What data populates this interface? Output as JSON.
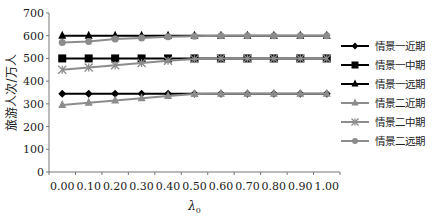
{
  "chart_data": {
    "type": "line",
    "title": "",
    "xlabel": "λ0",
    "ylabel": "旅游人次/万人",
    "ylim": [
      0,
      700
    ],
    "yticks": [
      0,
      100,
      200,
      300,
      400,
      500,
      600,
      700
    ],
    "grid": false,
    "legend_position": "right",
    "x": [
      "0.00",
      "0.10",
      "0.20",
      "0.30",
      "0.40",
      "0.50",
      "0.60",
      "0.70",
      "0.80",
      "0.90",
      "1.00"
    ],
    "series": [
      {
        "name": "情景一近期",
        "marker": "diamond",
        "color": "#000000",
        "values": [
          345,
          345,
          345,
          345,
          345,
          345,
          345,
          345,
          345,
          345,
          345
        ]
      },
      {
        "name": "情景一中期",
        "marker": "square",
        "color": "#000000",
        "values": [
          500,
          500,
          500,
          500,
          500,
          500,
          500,
          500,
          500,
          500,
          500
        ]
      },
      {
        "name": "情景一远期",
        "marker": "triangle",
        "color": "#000000",
        "values": [
          600,
          600,
          600,
          600,
          600,
          600,
          600,
          600,
          600,
          600,
          600
        ]
      },
      {
        "name": "情景二近期",
        "marker": "triangle",
        "color": "#8c8c8c",
        "values": [
          295,
          305,
          315,
          325,
          335,
          343,
          345,
          345,
          345,
          345,
          345
        ]
      },
      {
        "name": "情景二中期",
        "marker": "star",
        "color": "#8c8c8c",
        "values": [
          450,
          460,
          470,
          480,
          490,
          497,
          500,
          500,
          500,
          500,
          500
        ]
      },
      {
        "name": "情景二远期",
        "marker": "circle",
        "color": "#8c8c8c",
        "values": [
          570,
          575,
          585,
          590,
          595,
          598,
          600,
          600,
          600,
          600,
          600
        ]
      }
    ]
  }
}
